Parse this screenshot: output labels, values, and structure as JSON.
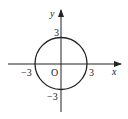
{
  "diagram": {
    "type": "coordinate-plane-circle",
    "axes": {
      "x_label": "x",
      "y_label": "y",
      "origin_label": "O"
    },
    "circle": {
      "center": [
        0,
        0
      ],
      "radius": 3
    },
    "tick_labels": {
      "x_neg": "−3",
      "x_pos": "3",
      "y_pos": "3",
      "y_neg": "−3"
    },
    "colors": {
      "stroke": "#222222",
      "background": "#ffffff"
    }
  }
}
